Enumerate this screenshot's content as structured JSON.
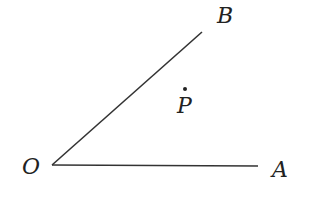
{
  "diagram": {
    "type": "angle",
    "points": {
      "O": {
        "label": "O",
        "x": 52,
        "y": 165
      },
      "A": {
        "label": "A",
        "x": 258,
        "y": 166
      },
      "B": {
        "label": "B",
        "x": 202,
        "y": 32
      },
      "P": {
        "label": "P",
        "x": 185,
        "y": 89
      }
    },
    "rays": [
      {
        "from": "O",
        "to": "A"
      },
      {
        "from": "O",
        "to": "B"
      }
    ],
    "stroke_color": "#333333"
  }
}
